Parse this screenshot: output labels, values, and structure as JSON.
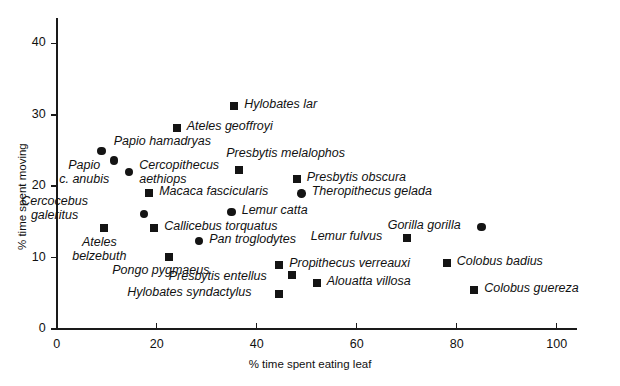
{
  "chart_data": {
    "type": "scatter",
    "title": "",
    "xlabel": "% time spent eating leaf",
    "ylabel": "% time spent moving",
    "xlim": [
      0,
      104
    ],
    "ylim": [
      0,
      45
    ],
    "xticks": [
      0,
      20,
      40,
      60,
      80,
      100
    ],
    "yticks": [
      0,
      10,
      20,
      30,
      40
    ],
    "grid": false,
    "legend": false,
    "marker_shapes": [
      "circle",
      "square"
    ],
    "points": [
      {
        "name": "Papio hamadryas",
        "x": 9.0,
        "y": 24.9,
        "shape": "circle",
        "label_dx": 12,
        "label_dy": -16,
        "lines": [
          "Papio hamadryas"
        ]
      },
      {
        "name": "Papio c. anubis",
        "x": 11.5,
        "y": 23.6,
        "shape": "circle",
        "label_dx": -55,
        "label_dy": -2,
        "lines": [
          "Papio",
          "c. anubis"
        ]
      },
      {
        "name": "Cercopithecus aethiops",
        "x": 14.5,
        "y": 22.0,
        "shape": "circle",
        "label_dx": 10,
        "label_dy": -14,
        "lines": [
          "Cercopithecus",
          "aethiops"
        ]
      },
      {
        "name": "Ateles geoffroyi",
        "x": 24.0,
        "y": 28.1,
        "shape": "square",
        "label_dx": 10,
        "label_dy": -8,
        "lines": [
          "Ateles geoffroyi"
        ]
      },
      {
        "name": "Hylobates lar",
        "x": 35.5,
        "y": 31.3,
        "shape": "square",
        "label_dx": 10,
        "label_dy": -8,
        "lines": [
          "Hylobates lar"
        ]
      },
      {
        "name": "Presbytis melalophos",
        "x": 36.5,
        "y": 22.2,
        "shape": "square",
        "label_dx": -13,
        "label_dy": -23,
        "lines": [
          "Presbytis melalophos"
        ]
      },
      {
        "name": "Macaca fascicularis",
        "x": 18.5,
        "y": 19.0,
        "shape": "square",
        "label_dx": 10,
        "label_dy": -8,
        "lines": [
          "Macaca fascicularis"
        ]
      },
      {
        "name": "Cercocebus galeritus",
        "x": 17.5,
        "y": 16.1,
        "shape": "circle",
        "label_dx": -123,
        "label_dy": -20,
        "lines": [
          "Cercocebus",
          "galeritus"
        ]
      },
      {
        "name": "Presbytis obscura",
        "x": 48.0,
        "y": 21.0,
        "shape": "square",
        "label_dx": 10,
        "label_dy": -8,
        "lines": [
          "Presbytis obscura"
        ]
      },
      {
        "name": "Theropithecus gelada",
        "x": 49.0,
        "y": 19.0,
        "shape": "circle",
        "label_dx": 10,
        "label_dy": -8,
        "lines": [
          "Theropithecus gelada"
        ]
      },
      {
        "name": "Lemur catta",
        "x": 35.0,
        "y": 16.4,
        "shape": "circle",
        "label_dx": 10,
        "label_dy": -8,
        "lines": [
          "Lemur catta"
        ]
      },
      {
        "name": "Callicebus torquatus",
        "x": 19.5,
        "y": 14.2,
        "shape": "square",
        "label_dx": 10,
        "label_dy": -8,
        "lines": [
          "Callicebus torquatus"
        ]
      },
      {
        "name": "Ateles belzebuth",
        "x": 9.5,
        "y": 14.1,
        "shape": "square",
        "label_dx": -32,
        "label_dy": 7,
        "lines": [
          "Ateles",
          "belzebuth"
        ]
      },
      {
        "name": "Pan troglodytes",
        "x": 28.5,
        "y": 12.3,
        "shape": "circle",
        "label_dx": 10,
        "label_dy": -8,
        "lines": [
          "Pan troglodytes"
        ]
      },
      {
        "name": "Lemur fulvus",
        "x": 70.0,
        "y": 12.7,
        "shape": "square",
        "label_dx": -96,
        "label_dy": -8,
        "lines": [
          "Lemur fulvus"
        ]
      },
      {
        "name": "Gorilla gorilla",
        "x": 85.0,
        "y": 14.3,
        "shape": "circle",
        "label_dx": -94,
        "label_dy": -8,
        "lines": [
          "Gorilla gorilla"
        ]
      },
      {
        "name": "Pongo pygmaeus",
        "x": 22.5,
        "y": 10.1,
        "shape": "square",
        "label_dx": -57,
        "label_dy": 7,
        "lines": [
          "Pongo pygmaeus"
        ]
      },
      {
        "name": "Propithecus verreauxi",
        "x": 44.5,
        "y": 9.0,
        "shape": "square",
        "label_dx": 10,
        "label_dy": -8,
        "lines": [
          "Propithecus verreauxi"
        ]
      },
      {
        "name": "Presbytis entellus",
        "x": 47.0,
        "y": 7.5,
        "shape": "square",
        "label_dx": -123,
        "label_dy": -5,
        "lines": [
          "Presbytis entellus"
        ]
      },
      {
        "name": "Alouatta villosa",
        "x": 52.0,
        "y": 6.5,
        "shape": "square",
        "label_dx": 10,
        "label_dy": -8,
        "lines": [
          "Alouatta villosa"
        ]
      },
      {
        "name": "Hylobates syndactylus",
        "x": 44.5,
        "y": 4.9,
        "shape": "square",
        "label_dx": -152,
        "label_dy": -8,
        "lines": [
          "Hylobates syndactylus"
        ]
      },
      {
        "name": "Colobus badius",
        "x": 78.0,
        "y": 9.2,
        "shape": "square",
        "label_dx": 10,
        "label_dy": -8,
        "lines": [
          "Colobus badius"
        ]
      },
      {
        "name": "Colobus guereza",
        "x": 83.5,
        "y": 5.5,
        "shape": "square",
        "label_dx": 10,
        "label_dy": -8,
        "lines": [
          "Colobus  guereza"
        ]
      }
    ]
  },
  "axes": {
    "x_title": "% time spent eating leaf",
    "y_title": "% time spent moving",
    "x_tick_labels": [
      "0",
      "20",
      "40",
      "60",
      "80",
      "100"
    ],
    "y_tick_labels": [
      "0",
      "10",
      "20",
      "30",
      "40"
    ]
  },
  "colors": {
    "marker": "#141414",
    "axis": "#1a1a1a",
    "text": "#111111",
    "background": "#ffffff"
  }
}
